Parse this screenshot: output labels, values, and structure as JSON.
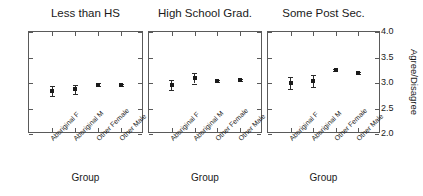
{
  "chart_data": {
    "type": "scatter",
    "title": "",
    "xlabel": "Group",
    "ylabel": "Agree/Disagree",
    "ylim": [
      2.0,
      4.0
    ],
    "ytick_labels": [
      "4.0",
      "3.5",
      "3.0",
      "2.5",
      "2.0"
    ],
    "ytick_values": [
      4.0,
      3.5,
      3.0,
      2.5,
      2.0
    ],
    "grid": false,
    "legend": "none",
    "categories": [
      "Aboriginal F",
      "Aboriginal M",
      "Other Female",
      "Other Male"
    ],
    "panels": [
      {
        "title": "Less than HS",
        "xlabel": "Group",
        "categories": [
          "Aboriginal F",
          "Aboriginal M",
          "Other Female",
          "Other Male"
        ],
        "values": [
          2.85,
          2.88,
          2.97,
          2.96
        ],
        "errors": [
          0.1,
          0.09,
          0.03,
          0.02
        ]
      },
      {
        "title": "High School Grad.",
        "xlabel": "Group",
        "categories": [
          "Aboriginal F",
          "Aboriginal M",
          "Other Female",
          "Other Male"
        ],
        "values": [
          2.96,
          3.09,
          3.03,
          3.06
        ],
        "errors": [
          0.1,
          0.1,
          0.02,
          0.02
        ]
      },
      {
        "title": "Some Post Sec.",
        "xlabel": "Group",
        "categories": [
          "Aboriginal F",
          "Aboriginal M",
          "Other Female",
          "Other Male"
        ],
        "values": [
          3.0,
          3.04,
          3.25,
          3.2
        ],
        "errors": [
          0.11,
          0.11,
          0.02,
          0.02
        ]
      }
    ]
  },
  "axes": {
    "y": {
      "title": "Agree/Disagree",
      "ticks": [
        {
          "label": "4.0",
          "value": 4.0
        },
        {
          "label": "3.5",
          "value": 3.5
        },
        {
          "label": "3.0",
          "value": 3.0
        },
        {
          "label": "2.5",
          "value": 2.5
        },
        {
          "label": "2.0",
          "value": 2.0
        }
      ]
    }
  }
}
